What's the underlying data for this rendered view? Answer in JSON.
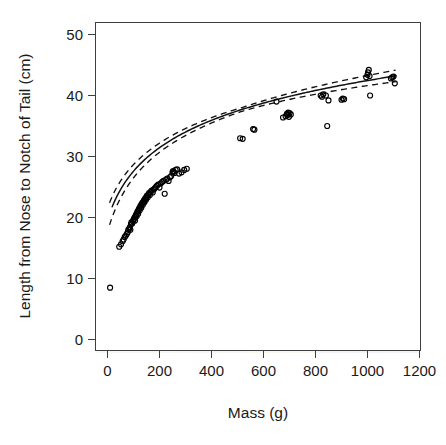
{
  "chart_data": {
    "type": "scatter",
    "title": "",
    "xlabel": "Mass (g)",
    "ylabel": "Length from Nose to Notch of Tail (cm)",
    "xlim": [
      -60,
      1260
    ],
    "ylim": [
      -2,
      52
    ],
    "xticks": [
      0,
      200,
      400,
      600,
      800,
      1000,
      1200
    ],
    "yticks": [
      0,
      10,
      20,
      30,
      40,
      50
    ],
    "xticklabels": [
      "0",
      "200",
      "400",
      "600",
      "800",
      "1000",
      "1200"
    ],
    "yticklabels": [
      "0",
      "10",
      "20",
      "30",
      "40",
      "50"
    ],
    "grid": false,
    "legend": false,
    "marker": "open-circle",
    "marker_color": "#000000",
    "series": [
      {
        "name": "observations",
        "type": "scatter",
        "x": [
          10,
          45,
          52,
          58,
          62,
          66,
          70,
          74,
          78,
          80,
          84,
          86,
          88,
          90,
          92,
          95,
          98,
          100,
          102,
          104,
          106,
          108,
          110,
          112,
          114,
          116,
          118,
          120,
          122,
          124,
          126,
          128,
          130,
          132,
          134,
          136,
          138,
          140,
          142,
          144,
          146,
          148,
          150,
          152,
          155,
          158,
          160,
          163,
          166,
          170,
          174,
          178,
          182,
          186,
          190,
          195,
          200,
          205,
          210,
          215,
          220,
          225,
          230,
          235,
          240,
          245,
          250,
          252,
          255,
          258,
          262,
          268,
          275,
          285,
          295,
          305,
          510,
          520,
          560,
          565,
          650,
          675,
          685,
          690,
          692,
          695,
          698,
          700,
          705,
          820,
          825,
          830,
          840,
          845,
          850,
          900,
          905,
          910,
          995,
          1000,
          1002,
          1005,
          1008,
          1010,
          1090,
          1095,
          1100,
          1105
        ],
        "y": [
          8.5,
          15.2,
          15.6,
          16.1,
          16.4,
          16.8,
          17.0,
          17.3,
          17.6,
          18.0,
          18.2,
          18.4,
          18.0,
          18.9,
          19.2,
          19.0,
          19.4,
          19.6,
          19.8,
          20.0,
          19.5,
          20.3,
          20.5,
          20.2,
          20.8,
          21.0,
          20.6,
          21.3,
          21.5,
          21.2,
          21.8,
          22.0,
          21.6,
          22.2,
          22.4,
          22.1,
          22.6,
          22.8,
          22.5,
          23.0,
          23.2,
          22.9,
          23.4,
          23.6,
          23.3,
          23.8,
          24.0,
          23.7,
          24.2,
          24.4,
          24.1,
          24.6,
          24.8,
          25.0,
          25.2,
          25.4,
          24.9,
          25.6,
          25.8,
          26.0,
          23.9,
          26.2,
          26.4,
          26.0,
          26.6,
          26.8,
          27.4,
          27.6,
          27.5,
          27.3,
          27.8,
          27.9,
          27.2,
          27.4,
          27.8,
          28.0,
          33.0,
          32.9,
          34.5,
          34.4,
          39.0,
          36.4,
          36.6,
          37.0,
          36.8,
          37.2,
          36.5,
          37.1,
          36.9,
          40.0,
          39.8,
          40.2,
          40.0,
          35.0,
          39.2,
          39.3,
          39.5,
          39.4,
          43.0,
          43.4,
          43.8,
          44.2,
          43.2,
          40.0,
          42.8,
          43.0,
          43.1,
          42.0
        ]
      },
      {
        "name": "fitted curve",
        "type": "line",
        "style": "solid",
        "description": "logarithmic growth fit"
      },
      {
        "name": "confidence band upper",
        "type": "line",
        "style": "dashed"
      },
      {
        "name": "confidence band lower",
        "type": "line",
        "style": "dashed"
      }
    ]
  },
  "axes": {
    "x_title": "Mass (g)",
    "y_title": "Length from Nose to Notch of Tail (cm)"
  },
  "colors": {
    "marker": "#000000",
    "fit": "#111111",
    "frame": "#3c4043",
    "background": "#ffffff"
  }
}
